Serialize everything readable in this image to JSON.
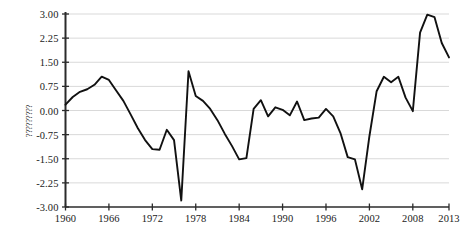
{
  "chart": {
    "type": "line",
    "ylabel_text": "?????????",
    "background_color": "#ffffff",
    "line_color": "#111111",
    "grid_color": "#d9d9d9",
    "axis_color": "#2b2b2b"
  },
  "chart_data": {
    "type": "line",
    "title": "",
    "xlabel": "",
    "ylabel": "?????????",
    "xlim": [
      1960,
      2013
    ],
    "ylim": [
      -3.0,
      3.0
    ],
    "grid": true,
    "legend": false,
    "xticks": [
      1960,
      1966,
      1972,
      1978,
      1984,
      1990,
      1996,
      2002,
      2008,
      2013
    ],
    "xtick_labels": [
      "1960",
      "1966",
      "1972",
      "1978",
      "1984",
      "1990",
      "1996",
      "2002",
      "2008",
      "2013"
    ],
    "yticks": [
      3.0,
      2.25,
      1.5,
      0.75,
      0.0,
      -0.75,
      -1.5,
      -2.25,
      -3.0
    ],
    "ytick_labels": [
      "3.00",
      "2.25",
      "1.50",
      "0.75",
      "0.00",
      "-0.75",
      "-1.50",
      "-2.25",
      "-3.00"
    ],
    "x": [
      1960,
      1961,
      1962,
      1963,
      1964,
      1965,
      1966,
      1967,
      1968,
      1969,
      1970,
      1971,
      1972,
      1973,
      1974,
      1975,
      1976,
      1977,
      1978,
      1979,
      1980,
      1981,
      1982,
      1983,
      1984,
      1985,
      1986,
      1987,
      1988,
      1989,
      1990,
      1991,
      1992,
      1993,
      1994,
      1995,
      1996,
      1997,
      1998,
      1999,
      2000,
      2001,
      2002,
      2003,
      2004,
      2005,
      2006,
      2007,
      2008,
      2009,
      2010,
      2011,
      2012,
      2013
    ],
    "values": [
      0.18,
      0.42,
      0.58,
      0.66,
      0.8,
      1.05,
      0.95,
      0.62,
      0.3,
      -0.12,
      -0.55,
      -0.92,
      -1.2,
      -1.22,
      -0.6,
      -0.92,
      -2.8,
      1.22,
      0.45,
      0.3,
      0.05,
      -0.3,
      -0.72,
      -1.1,
      -1.52,
      -1.48,
      0.05,
      0.32,
      -0.18,
      0.1,
      0.02,
      -0.15,
      0.28,
      -0.3,
      -0.25,
      -0.22,
      0.05,
      -0.18,
      -0.7,
      -1.45,
      -1.52,
      -2.45,
      -0.8,
      0.6,
      1.05,
      0.88,
      1.05,
      0.4,
      -0.02,
      2.42,
      2.98,
      2.9,
      2.1,
      1.65
    ],
    "series": [
      {
        "name": "series-1",
        "values": [
          0.18,
          0.42,
          0.58,
          0.66,
          0.8,
          1.05,
          0.95,
          0.62,
          0.3,
          -0.12,
          -0.55,
          -0.92,
          -1.2,
          -1.22,
          -0.6,
          -0.92,
          -2.8,
          1.22,
          0.45,
          0.3,
          0.05,
          -0.3,
          -0.72,
          -1.1,
          -1.52,
          -1.48,
          0.05,
          0.32,
          -0.18,
          0.1,
          0.02,
          -0.15,
          0.28,
          -0.3,
          -0.25,
          -0.22,
          0.05,
          -0.18,
          -0.7,
          -1.45,
          -1.52,
          -2.45,
          -0.8,
          0.6,
          1.05,
          0.88,
          1.05,
          0.4,
          -0.02,
          2.42,
          2.98,
          2.9,
          2.1,
          1.65
        ]
      }
    ]
  }
}
